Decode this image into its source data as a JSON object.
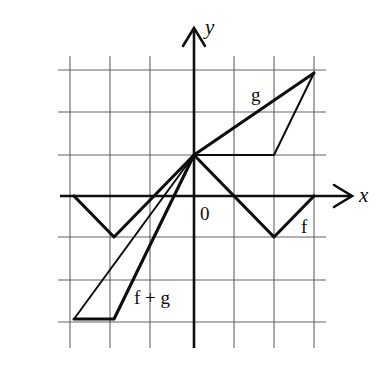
{
  "figure": {
    "background_color": "#ffffff",
    "ink_color": "#0d0d0d",
    "grid_color": "#4a4a4a"
  },
  "axes": {
    "x_label": "x",
    "y_label": "y",
    "origin_label": "0",
    "origin_px": {
      "x": 194,
      "y": 196
    },
    "unit_px": {
      "x": 40,
      "y": 41
    },
    "x_range": [
      -3.1,
      4.3
    ],
    "y_range": [
      -3.1,
      3.4
    ],
    "grid_vertical_px": [
      70,
      110,
      150,
      194,
      234,
      274,
      314
    ],
    "grid_horizontal_px": [
      70,
      112,
      155,
      196,
      237,
      280,
      322
    ],
    "grid_visible": true
  },
  "labels": {
    "g": "g",
    "f": "f",
    "f_plus_g": "f + g"
  },
  "chart_data": {
    "type": "line",
    "xlabel": "x",
    "ylabel": "y",
    "xlim": [
      -3.1,
      4.3
    ],
    "ylim": [
      -3.1,
      3.4
    ],
    "grid": true,
    "legend": "inline-annotations",
    "annotations": [
      {
        "text": "g",
        "x": 1.55,
        "y": 2.25
      },
      {
        "text": "f",
        "x": 2.85,
        "y": -0.75
      },
      {
        "text": "f + g",
        "x": -1.0,
        "y": -2.25
      },
      {
        "text": "0",
        "x": 0.2,
        "y": -0.35
      }
    ],
    "series": [
      {
        "name": "f",
        "style": "thick",
        "points": [
          {
            "x": -3,
            "y": 0
          },
          {
            "x": -2,
            "y": -1
          },
          {
            "x": 0,
            "y": 1
          },
          {
            "x": 2,
            "y": -1
          },
          {
            "x": 3,
            "y": 0
          }
        ]
      },
      {
        "name": "g",
        "style": "thin",
        "points": [
          {
            "x": -3,
            "y": -3
          },
          {
            "x": 0,
            "y": 1
          },
          {
            "x": 2,
            "y": 1
          },
          {
            "x": 3,
            "y": 3
          }
        ]
      },
      {
        "name": "f + g",
        "style": "thick",
        "points": [
          {
            "x": -3,
            "y": -3
          },
          {
            "x": -2,
            "y": -3
          },
          {
            "x": 0,
            "y": 1
          },
          {
            "x": 3,
            "y": 3
          }
        ]
      }
    ]
  }
}
